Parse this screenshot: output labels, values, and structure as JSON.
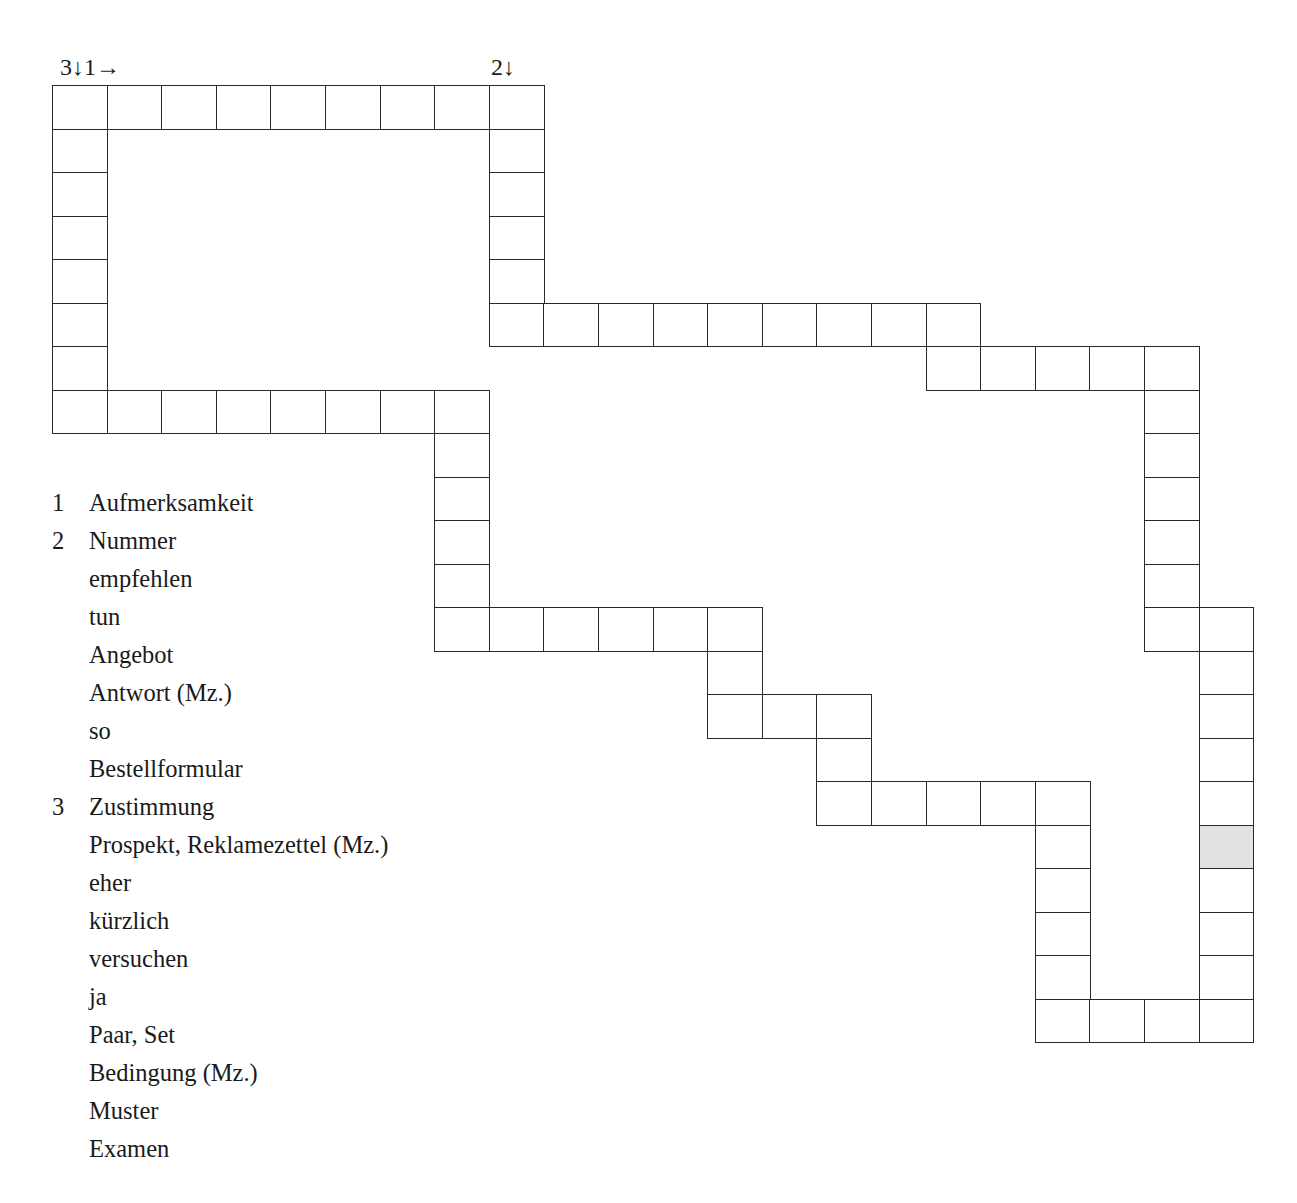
{
  "markers": {
    "start_1_3": "3↓1→",
    "start_2": "2↓"
  },
  "clues": [
    {
      "num": "1",
      "text": "Aufmerksamkeit"
    },
    {
      "num": "2",
      "text": "Nummer"
    },
    {
      "num": "",
      "text": "empfehlen"
    },
    {
      "num": "",
      "text": "tun"
    },
    {
      "num": "",
      "text": "Angebot"
    },
    {
      "num": "",
      "text": "Antwort (Mz.)"
    },
    {
      "num": "",
      "text": "so"
    },
    {
      "num": "",
      "text": "Bestellformular"
    },
    {
      "num": "3",
      "text": "Zustimmung"
    },
    {
      "num": "",
      "text": "Prospekt, Reklamezettel (Mz.)"
    },
    {
      "num": "",
      "text": "eher"
    },
    {
      "num": "",
      "text": "kürzlich"
    },
    {
      "num": "",
      "text": "versuchen"
    },
    {
      "num": "",
      "text": "ja"
    },
    {
      "num": "",
      "text": "Paar, Set"
    },
    {
      "num": "",
      "text": "Bedingung (Mz.)"
    },
    {
      "num": "",
      "text": "Muster"
    },
    {
      "num": "",
      "text": "Examen"
    }
  ],
  "colors": {
    "shaded_cell": "#e2e2e2",
    "grid_line": "#2a2a2a"
  }
}
